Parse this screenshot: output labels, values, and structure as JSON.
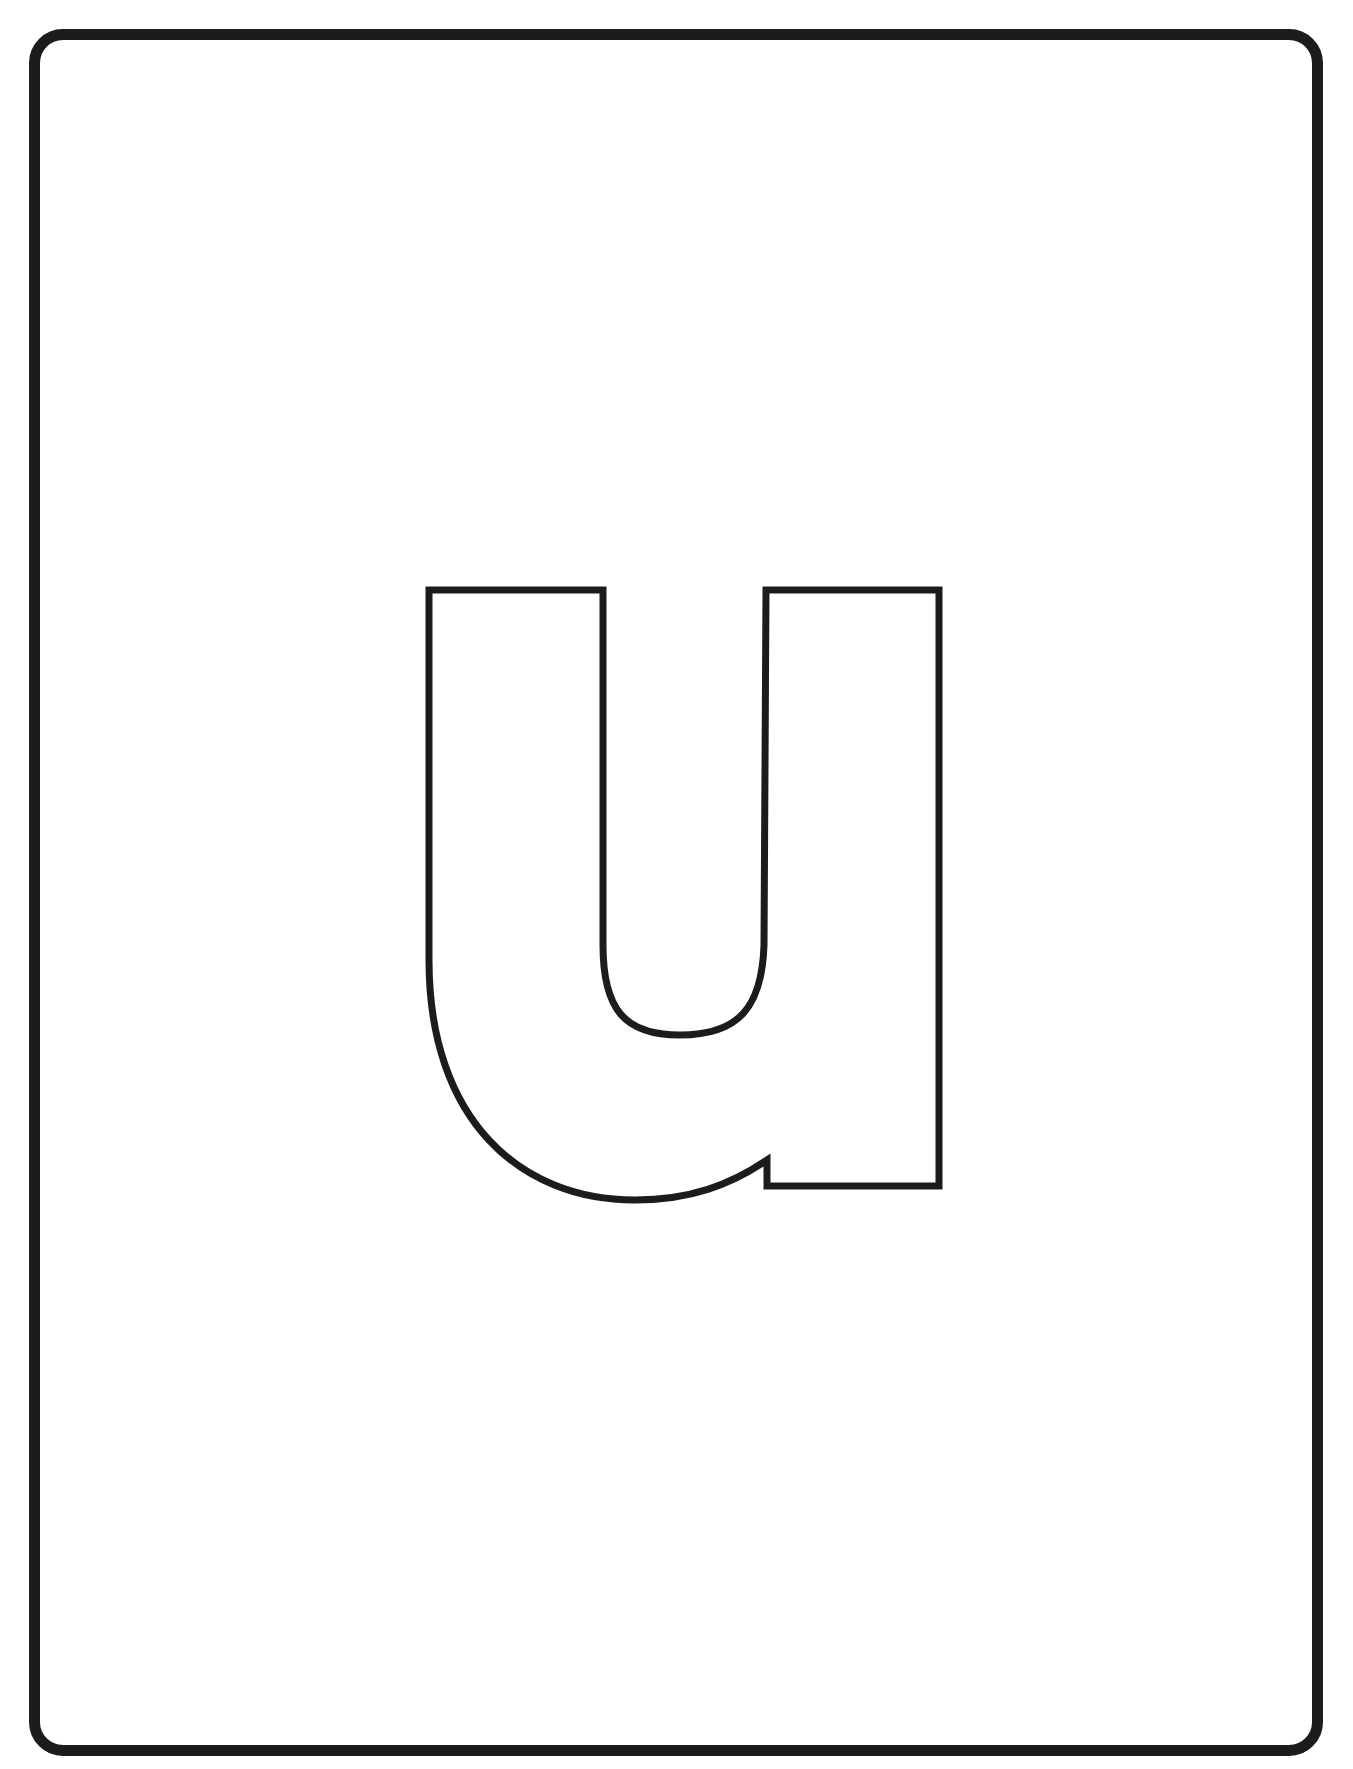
{
  "worksheet": {
    "letter": "u",
    "style": "outline",
    "stroke_color": "#1c1c1c",
    "frame_color": "#1c1c1c",
    "background_color": "#ffffff"
  }
}
